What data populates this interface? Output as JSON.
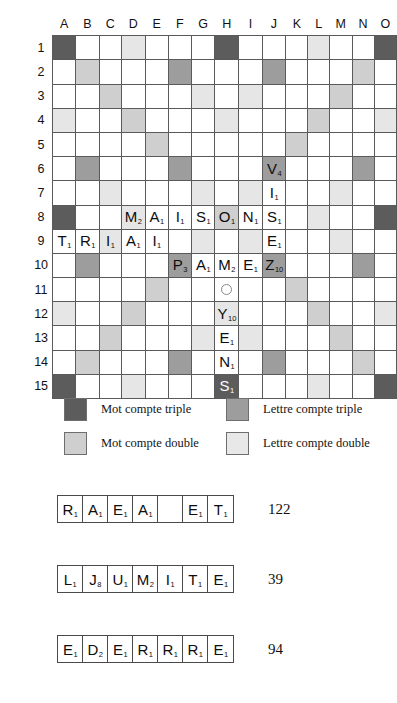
{
  "board": {
    "columns": [
      "A",
      "B",
      "C",
      "D",
      "E",
      "F",
      "G",
      "H",
      "I",
      "J",
      "K",
      "L",
      "M",
      "N",
      "O"
    ],
    "rows": [
      "1",
      "2",
      "3",
      "4",
      "5",
      "6",
      "7",
      "8",
      "9",
      "10",
      "11",
      "12",
      "13",
      "14",
      "15"
    ],
    "colors": {
      "triple_word": "#5c5c5c",
      "triple_letter": "#9d9d9d",
      "double_word": "#cfcfcf",
      "double_letter": "#e6e6e6",
      "empty": "#ffffff",
      "grid_line": "#5a5a5a"
    },
    "bonus_layout": [
      [
        "tw",
        "",
        "",
        "dl",
        "",
        "",
        "",
        "tw",
        "",
        "",
        "",
        "dl",
        "",
        "",
        "tw"
      ],
      [
        "",
        "dw",
        "",
        "",
        "",
        "tl",
        "",
        "",
        "",
        "tl",
        "",
        "",
        "",
        "dw",
        ""
      ],
      [
        "",
        "",
        "dw",
        "",
        "",
        "",
        "dl",
        "",
        "dl",
        "",
        "",
        "",
        "dw",
        "",
        ""
      ],
      [
        "dl",
        "",
        "",
        "dw",
        "",
        "",
        "",
        "dl",
        "",
        "",
        "",
        "dw",
        "",
        "",
        "dl"
      ],
      [
        "",
        "",
        "",
        "",
        "dw",
        "",
        "",
        "",
        "",
        "",
        "dw",
        "",
        "",
        "",
        ""
      ],
      [
        "",
        "tl",
        "",
        "",
        "",
        "tl",
        "",
        "",
        "",
        "tl",
        "",
        "",
        "",
        "tl",
        ""
      ],
      [
        "",
        "",
        "dl",
        "",
        "",
        "",
        "dl",
        "",
        "dl",
        "",
        "",
        "",
        "dl",
        "",
        ""
      ],
      [
        "tw",
        "",
        "",
        "dl",
        "",
        "",
        "",
        "dw",
        "",
        "",
        "",
        "dl",
        "",
        "",
        "tw"
      ],
      [
        "",
        "",
        "dl",
        "",
        "",
        "",
        "dl",
        "",
        "dl",
        "",
        "",
        "",
        "dl",
        "",
        ""
      ],
      [
        "",
        "tl",
        "",
        "",
        "",
        "tl",
        "",
        "",
        "",
        "tl",
        "",
        "",
        "",
        "tl",
        ""
      ],
      [
        "",
        "",
        "",
        "",
        "dw",
        "",
        "",
        "",
        "",
        "",
        "dw",
        "",
        "",
        "",
        ""
      ],
      [
        "dl",
        "",
        "",
        "dw",
        "",
        "",
        "",
        "dl",
        "",
        "",
        "",
        "dw",
        "",
        "",
        "dl"
      ],
      [
        "",
        "",
        "dw",
        "",
        "",
        "",
        "dl",
        "",
        "dl",
        "",
        "",
        "",
        "dw",
        "",
        ""
      ],
      [
        "",
        "dw",
        "",
        "",
        "",
        "tl",
        "",
        "",
        "",
        "tl",
        "",
        "",
        "",
        "dw",
        ""
      ],
      [
        "tw",
        "",
        "",
        "dl",
        "",
        "",
        "",
        "tw",
        "",
        "",
        "",
        "dl",
        "",
        "",
        "tw"
      ]
    ],
    "center_marker": {
      "row": 11,
      "col": "H",
      "icon": "star-circle-icon"
    },
    "tiles": [
      {
        "col": "D",
        "row": 8,
        "letter": "M",
        "value": "2"
      },
      {
        "col": "E",
        "row": 8,
        "letter": "A",
        "value": "1"
      },
      {
        "col": "F",
        "row": 8,
        "letter": "I",
        "value": "1"
      },
      {
        "col": "G",
        "row": 8,
        "letter": "S",
        "value": "1"
      },
      {
        "col": "H",
        "row": 8,
        "letter": "O",
        "value": "1"
      },
      {
        "col": "I",
        "row": 8,
        "letter": "N",
        "value": "1"
      },
      {
        "col": "J",
        "row": 8,
        "letter": "S",
        "value": "1"
      },
      {
        "col": "A",
        "row": 9,
        "letter": "T",
        "value": "1"
      },
      {
        "col": "B",
        "row": 9,
        "letter": "R",
        "value": "1"
      },
      {
        "col": "C",
        "row": 9,
        "letter": "I",
        "value": "1"
      },
      {
        "col": "D",
        "row": 9,
        "letter": "A",
        "value": "1"
      },
      {
        "col": "E",
        "row": 9,
        "letter": "I",
        "value": "1"
      },
      {
        "col": "J",
        "row": 6,
        "letter": "V",
        "value": "4"
      },
      {
        "col": "J",
        "row": 7,
        "letter": "I",
        "value": "1"
      },
      {
        "col": "J",
        "row": 9,
        "letter": "E",
        "value": "1"
      },
      {
        "col": "F",
        "row": 10,
        "letter": "P",
        "value": "3"
      },
      {
        "col": "G",
        "row": 10,
        "letter": "A",
        "value": "1"
      },
      {
        "col": "H",
        "row": 10,
        "letter": "M",
        "value": "2"
      },
      {
        "col": "I",
        "row": 10,
        "letter": "E",
        "value": "1"
      },
      {
        "col": "J",
        "row": 10,
        "letter": "Z",
        "value": "10"
      },
      {
        "col": "H",
        "row": 12,
        "letter": "Y",
        "value": "10"
      },
      {
        "col": "H",
        "row": 13,
        "letter": "E",
        "value": "1"
      },
      {
        "col": "H",
        "row": 14,
        "letter": "N",
        "value": "1"
      },
      {
        "col": "H",
        "row": 15,
        "letter": "S",
        "value": "1"
      }
    ]
  },
  "legend": {
    "items": [
      {
        "swatch": "tw",
        "label": "Mot compte triple"
      },
      {
        "swatch": "tl",
        "label": "Lettre compte triple"
      },
      {
        "swatch": "dw",
        "label": "Mot compte double"
      },
      {
        "swatch": "dl",
        "label": "Lettre compte double"
      }
    ]
  },
  "racks": [
    {
      "tiles": [
        {
          "letter": "R",
          "value": "1"
        },
        {
          "letter": "A",
          "value": "1"
        },
        {
          "letter": "E",
          "value": "1"
        },
        {
          "letter": "A",
          "value": "1"
        },
        {
          "letter": "",
          "value": ""
        },
        {
          "letter": "E",
          "value": "1"
        },
        {
          "letter": "T",
          "value": "1"
        }
      ],
      "score": "122"
    },
    {
      "tiles": [
        {
          "letter": "L",
          "value": "1"
        },
        {
          "letter": "J",
          "value": "8"
        },
        {
          "letter": "U",
          "value": "1"
        },
        {
          "letter": "M",
          "value": "2"
        },
        {
          "letter": "I",
          "value": "1"
        },
        {
          "letter": "T",
          "value": "1"
        },
        {
          "letter": "E",
          "value": "1"
        }
      ],
      "score": "39"
    },
    {
      "tiles": [
        {
          "letter": "E",
          "value": "1"
        },
        {
          "letter": "D",
          "value": "2"
        },
        {
          "letter": "E",
          "value": "1"
        },
        {
          "letter": "R",
          "value": "1"
        },
        {
          "letter": "R",
          "value": "1"
        },
        {
          "letter": "R",
          "value": "1"
        },
        {
          "letter": "E",
          "value": "1"
        }
      ],
      "score": "94"
    }
  ]
}
